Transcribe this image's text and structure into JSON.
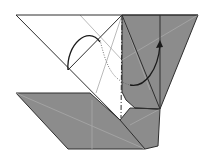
{
  "diagram": {
    "type": "origami-fold-step",
    "colors": {
      "background": "#ffffff",
      "paper_white": "#ffffff",
      "paper_colored": "#8c8c8c",
      "edge": "#2e2e2e",
      "crease": "#a8a8a8",
      "arrow": "#1a1a1a"
    },
    "elements": [
      {
        "name": "white-paper-region",
        "kind": "paper-face",
        "color": "white"
      },
      {
        "name": "gray-upper-right-flap",
        "kind": "paper-face",
        "color": "gray"
      },
      {
        "name": "gray-lower-flap",
        "kind": "paper-face",
        "color": "gray"
      },
      {
        "name": "mountain-fold-line",
        "kind": "dash-dot-line"
      },
      {
        "name": "valley-fold-line",
        "kind": "dotted-line"
      },
      {
        "name": "fold-arrow-left",
        "kind": "curved-arrow"
      },
      {
        "name": "fold-arrow-right",
        "kind": "curved-arrow-with-head"
      }
    ]
  }
}
